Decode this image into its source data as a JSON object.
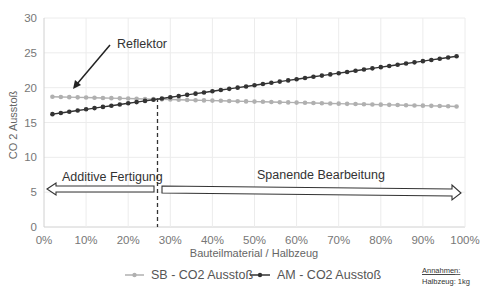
{
  "chart_data": {
    "type": "line",
    "title": "",
    "xlabel": "Bauteilmaterial / Halbzeug",
    "ylabel": "CO 2 Ausstoß",
    "xlim": [
      0,
      100
    ],
    "ylim": [
      0,
      30
    ],
    "x_ticks": [
      "0%",
      "10%",
      "20%",
      "30%",
      "40%",
      "50%",
      "60%",
      "70%",
      "80%",
      "90%",
      "100%"
    ],
    "y_ticks": [
      "0",
      "5",
      "10",
      "15",
      "20",
      "25",
      "30"
    ],
    "grid": true,
    "legend_position": "bottom",
    "series": [
      {
        "name": "SB - CO2 Ausstoß",
        "color": "#b0b0b0",
        "x_start": 2,
        "x_end": 98,
        "y_start": 18.7,
        "y_end": 17.3,
        "points": 49
      },
      {
        "name": "AM - CO2 Ausstoß",
        "color": "#333333",
        "x_start": 2,
        "x_end": 98,
        "y_start": 16.2,
        "y_end": 24.5,
        "points": 49
      }
    ],
    "intersection": {
      "x": 27.5,
      "y": 18.3
    },
    "annotations": {
      "reflector": "Reflektor",
      "left_arrow": "Additive Fertigung",
      "right_arrow": "Spanende Bearbeitung"
    }
  },
  "notes": {
    "title": "Annahmen:",
    "line1": "Halbzeug: 1kg"
  }
}
